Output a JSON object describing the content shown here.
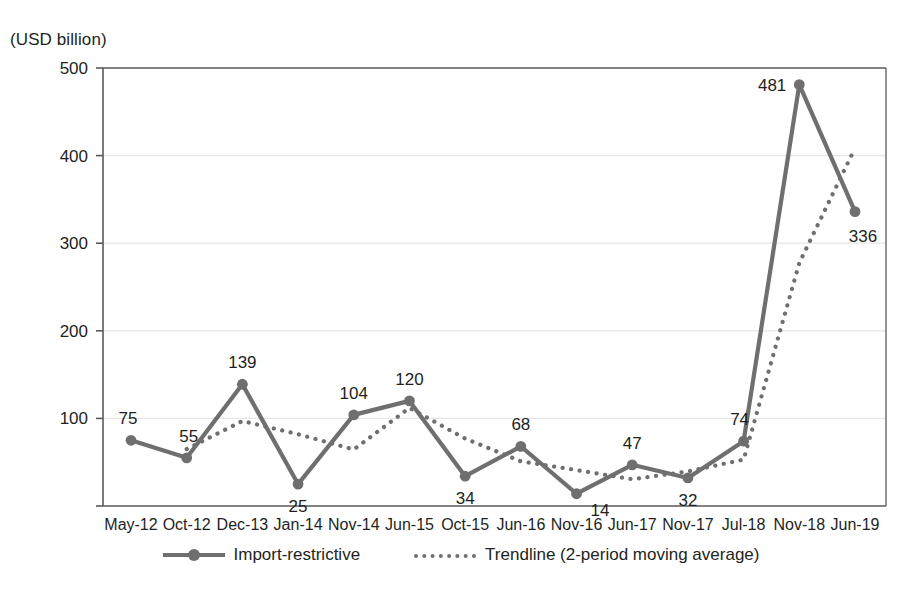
{
  "chart_data": {
    "type": "line",
    "title": "",
    "axis_unit_label": "(USD billion)",
    "xlabel": "",
    "ylabel": "(USD billion)",
    "ylim": [
      0,
      500
    ],
    "yticks": [
      0,
      100,
      200,
      300,
      400,
      500
    ],
    "ytick_labels": [
      "",
      "100",
      "200",
      "300",
      "400",
      "500"
    ],
    "grid": true,
    "legend_position": "bottom-center",
    "categories": [
      "May-12",
      "Oct-12",
      "Dec-13",
      "Jan-14",
      "Nov-14",
      "Jun-15",
      "Oct-15",
      "Jun-16",
      "Nov-16",
      "Jun-17",
      "Nov-17",
      "Jul-18",
      "Nov-18",
      "Jun-19"
    ],
    "series": [
      {
        "name": "Import-restrictive",
        "style": "solid-with-markers",
        "color": "#6f6f6f",
        "values": [
          75,
          55,
          139,
          25,
          104,
          120,
          34,
          68,
          14,
          47,
          32,
          74,
          481,
          336
        ],
        "labels": [
          "75",
          "55",
          "139",
          "25",
          "104",
          "120",
          "34",
          "68",
          "14",
          "47",
          "32",
          "74",
          "481",
          "336"
        ],
        "label_positions": [
          "above",
          "above",
          "above",
          "below",
          "above",
          "above",
          "below",
          "above",
          "below",
          "above",
          "below",
          "above",
          "above",
          "below"
        ]
      },
      {
        "name": "Trendline (2-period moving average)",
        "style": "dotted",
        "color": "#6f6f6f",
        "values": [
          null,
          65,
          97,
          82,
          64.5,
          112,
          77,
          51,
          41,
          30.5,
          39.5,
          53,
          277.5,
          408.5
        ]
      }
    ]
  },
  "legend": {
    "items": [
      {
        "label": "Import-restrictive",
        "style": "solid-marker"
      },
      {
        "label": "Trendline (2-period moving average)",
        "style": "dotted"
      }
    ]
  }
}
